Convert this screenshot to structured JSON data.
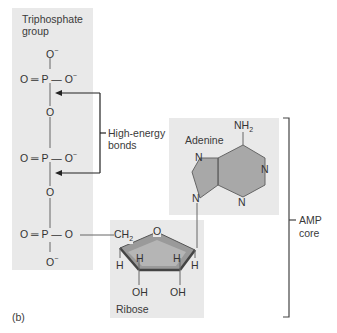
{
  "figure": {
    "panel_label": "(b)",
    "groups": {
      "triphosphate": "Triphosphate group",
      "triphosphate_line1": "Triphosphate",
      "triphosphate_line2": "group",
      "adenine": "Adenine",
      "ribose": "Ribose"
    },
    "annotations": {
      "high_energy_line1": "High-energy",
      "high_energy_line2": "bonds",
      "amp_line1": "AMP",
      "amp_line2": "core"
    },
    "atoms": {
      "O": "O",
      "P": "P",
      "O_minus": "O",
      "minus": "−",
      "N": "N",
      "NH2": "NH",
      "NH2_sub": "2",
      "CH2": "CH",
      "CH2_sub": "2",
      "H": "H",
      "OH": "OH",
      "eq": "═",
      "dash": "—"
    },
    "colors": {
      "box": "#e9e9e9",
      "ring_fill": "#9a9a9a",
      "line": "#555555"
    }
  }
}
